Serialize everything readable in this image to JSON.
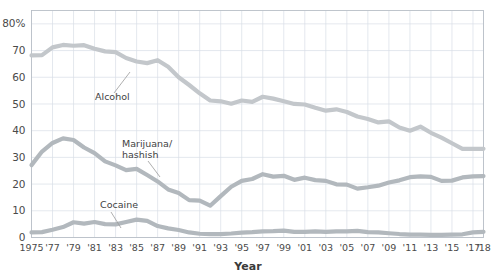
{
  "chart_data": {
    "type": "line",
    "title": "",
    "subtitle": "",
    "xlabel": "Year",
    "ylabel": "",
    "xlim": [
      1975,
      2018
    ],
    "ylim": [
      0,
      85
    ],
    "yticks": [
      0,
      10,
      20,
      30,
      40,
      50,
      60,
      70,
      80
    ],
    "ytick_labels": [
      "0",
      "10",
      "20",
      "30",
      "40",
      "50",
      "60",
      "70",
      "80%"
    ],
    "xticks": [
      1975,
      1977,
      1979,
      1981,
      1983,
      1985,
      1987,
      1989,
      1991,
      1993,
      1995,
      1997,
      1999,
      2001,
      2003,
      2005,
      2007,
      2009,
      2011,
      2013,
      2015,
      2017,
      2018
    ],
    "xtick_labels": [
      "1975",
      "'77",
      "'79",
      "'81",
      "'83",
      "'85",
      "'87",
      "'89",
      "'91",
      "'93",
      "'95",
      "'97",
      "'99",
      "'01",
      "'03",
      "'05",
      "'07",
      "'09",
      "'11",
      "'13",
      "'15",
      "'17",
      "'18"
    ],
    "grid": true,
    "legend_position": "inline-annotations",
    "x": [
      1975,
      1976,
      1977,
      1978,
      1979,
      1980,
      1981,
      1982,
      1983,
      1984,
      1985,
      1986,
      1987,
      1988,
      1989,
      1990,
      1991,
      1992,
      1993,
      1994,
      1995,
      1996,
      1997,
      1998,
      1999,
      2000,
      2001,
      2002,
      2003,
      2004,
      2005,
      2006,
      2007,
      2008,
      2009,
      2010,
      2011,
      2012,
      2013,
      2014,
      2015,
      2016,
      2017,
      2018
    ],
    "series": [
      {
        "name": "Alcohol",
        "color": "#c3c7cb",
        "values": [
          68.2,
          68.3,
          71.2,
          72.1,
          71.8,
          72.0,
          70.7,
          69.7,
          69.4,
          67.2,
          65.9,
          65.3,
          66.4,
          63.9,
          60.0,
          57.1,
          54.0,
          51.3,
          51.0,
          50.1,
          51.3,
          50.8,
          52.7,
          52.0,
          51.0,
          50.0,
          49.8,
          48.6,
          47.5,
          48.0,
          47.0,
          45.3,
          44.4,
          43.1,
          43.5,
          41.2,
          40.0,
          41.5,
          39.2,
          37.4,
          35.3,
          33.2,
          33.2,
          33.2
        ]
      },
      {
        "name": "Marijuana/hashish",
        "color": "#b2b8bd",
        "values": [
          27.1,
          32.2,
          35.4,
          37.1,
          36.5,
          33.7,
          31.6,
          28.5,
          27.0,
          25.2,
          25.7,
          23.4,
          21.0,
          18.0,
          16.7,
          14.0,
          13.8,
          11.9,
          15.5,
          19.0,
          21.2,
          21.9,
          23.7,
          22.8,
          23.1,
          21.6,
          22.4,
          21.5,
          21.2,
          19.9,
          19.8,
          18.3,
          18.8,
          19.4,
          20.6,
          21.4,
          22.6,
          22.9,
          22.7,
          21.2,
          21.3,
          22.5,
          22.9,
          23.0
        ]
      },
      {
        "name": "Cocaine",
        "color": "#b2b8bd",
        "values": [
          1.9,
          2.0,
          2.9,
          3.9,
          5.7,
          5.2,
          5.8,
          5.0,
          4.9,
          5.8,
          6.7,
          6.2,
          4.3,
          3.4,
          2.8,
          1.9,
          1.4,
          1.3,
          1.3,
          1.5,
          1.8,
          2.0,
          2.3,
          2.4,
          2.6,
          2.1,
          2.1,
          2.3,
          2.1,
          2.3,
          2.3,
          2.5,
          2.0,
          1.9,
          1.6,
          1.3,
          1.1,
          1.1,
          1.0,
          1.0,
          1.1,
          1.2,
          1.9,
          2.1
        ]
      }
    ],
    "annotations": [
      {
        "text": "Alcohol",
        "series": "Alcohol"
      },
      {
        "text": "Marijuana/",
        "series": "Marijuana/hashish"
      },
      {
        "text": "hashish",
        "series": "Marijuana/hashish"
      },
      {
        "text": "Cocaine",
        "series": "Cocaine"
      }
    ]
  },
  "labels": {
    "alcohol": "Alcohol",
    "marijuana_line1": "Marijuana/",
    "marijuana_line2": "hashish",
    "cocaine": "Cocaine",
    "xaxis_title": "Year"
  },
  "colors": {
    "series_gray": "#c1c6ca",
    "grid": "#d9dee6",
    "frame": "#b9bfc7",
    "text": "#4a4a4a",
    "background": "#ffffff"
  }
}
